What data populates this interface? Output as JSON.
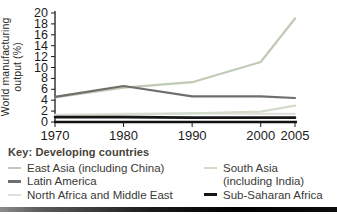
{
  "chart_data": {
    "type": "line",
    "title": "",
    "xlabel": "",
    "ylabel": "World manufacturing output (%)",
    "ylabel_lines": [
      "World manufacturing",
      "output (%)"
    ],
    "x": [
      1970,
      1980,
      1990,
      2000,
      2005
    ],
    "x_ticks": [
      "1970",
      "1980",
      "1990",
      "2000",
      "2005"
    ],
    "ylim": [
      0,
      20
    ],
    "y_tick_step": 2,
    "grid": false,
    "legend_position": "below",
    "series": [
      {
        "name": "East Asia (including China)",
        "color": "#bfcbb6",
        "width": 2.2,
        "values": [
          4.5,
          6.3,
          7.3,
          11,
          19
        ]
      },
      {
        "name": "Latin America",
        "color": "#6e6e6a",
        "width": 2.2,
        "values": [
          4.6,
          6.6,
          4.7,
          4.7,
          4.4
        ]
      },
      {
        "name": "North Africa and Middle East",
        "color": "#e0e0dd",
        "width": 2.2,
        "values": [
          1.3,
          1.5,
          1.6,
          1.5,
          1.5
        ]
      },
      {
        "name": "South Asia (including India)",
        "color": "#d3dbca",
        "width": 2.2,
        "values": [
          1.1,
          1.3,
          1.6,
          1.9,
          3.0
        ]
      },
      {
        "name": "Sub-Saharan Africa",
        "color": "#161616",
        "width": 2.6,
        "values": [
          0.9,
          0.9,
          0.8,
          0.8,
          0.8
        ]
      }
    ]
  },
  "key": {
    "title": "Key: Developing countries",
    "col1": [
      {
        "label": "East Asia (including China)",
        "color": "#bfcbb6"
      },
      {
        "label": "Latin America",
        "color": "#6e6e6a"
      },
      {
        "label": "North Africa and Middle East",
        "color": "#e0e0dd"
      }
    ],
    "col2": [
      {
        "label": "South Asia",
        "label2": "(including India)",
        "color": "#d3dbca"
      },
      {
        "label": "Sub-Saharan Africa",
        "color": "#161616"
      }
    ]
  }
}
